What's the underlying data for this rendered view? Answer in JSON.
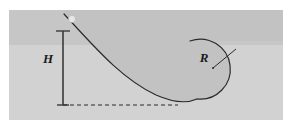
{
  "figure": {
    "canvas": {
      "width": 292,
      "height": 130
    },
    "panel": {
      "x": 9,
      "y": 10,
      "width": 274,
      "height": 110,
      "fill": "#d2d2d2"
    },
    "upper_band": {
      "x": 9,
      "y": 10,
      "width": 274,
      "height": 35,
      "fill": "#c3c3c3"
    },
    "ramp_body_fill": "#c4c4c4",
    "stroke_color": "#2b2b2b",
    "labels": [
      {
        "name": "height-label",
        "text": "H",
        "x": 48,
        "y": 63
      },
      {
        "name": "radius-label",
        "text": "R",
        "x": 204,
        "y": 62
      }
    ],
    "ball": {
      "name": "ball",
      "cx": 72,
      "cy": 19,
      "r": 3.6,
      "fill": "#e4e4e4"
    },
    "height_dimension": {
      "name": "height-dimension-line",
      "x": 63,
      "y_top": 31,
      "y_bottom": 105
    },
    "baseline": {
      "name": "baseline-dashed",
      "x_start": 63,
      "x_end": 178,
      "y": 105,
      "dash": "4 3"
    },
    "loop": {
      "name": "loop-circle",
      "cx": 213,
      "cy": 68,
      "r": 30
    },
    "radius_line": {
      "name": "radius-leader-line",
      "x1": 213,
      "y1": 68,
      "x2": 236,
      "y2": 49
    },
    "ramp_curve_path": "M 64 14 C 92 44, 120 78, 156 95 C 172 102, 186 104, 197 99",
    "loop_arc_path": "M 197 99 A 30 30 0 1 0 190 41"
  }
}
